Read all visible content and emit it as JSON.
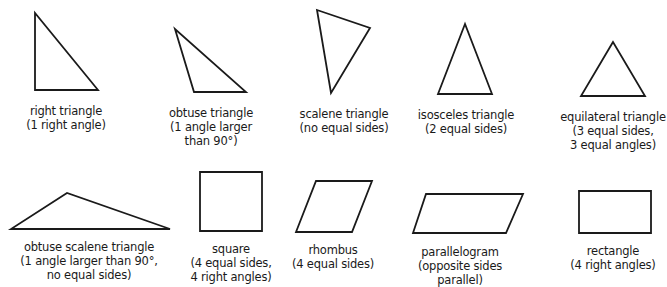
{
  "shapes": [
    {
      "id": "right-triangle",
      "name": "right triangle",
      "description_lines": [
        "(1 right angle)"
      ],
      "points": "35,13 35,90 98,90",
      "caption_x": 66,
      "caption_y": 104
    },
    {
      "id": "obtuse-triangle",
      "name": "obtuse triangle",
      "description_lines": [
        "(1 angle larger",
        "than 90°)"
      ],
      "points": "175,29 194,92 246,92",
      "caption_x": 211,
      "caption_y": 106
    },
    {
      "id": "scalene-triangle",
      "name": "scalene triangle",
      "description_lines": [
        "(no equal sides)"
      ],
      "points": "317,10 370,28 331,93",
      "caption_x": 344,
      "caption_y": 107
    },
    {
      "id": "isosceles-triangle",
      "name": "isosceles triangle",
      "description_lines": [
        "(2 equal sides)"
      ],
      "points": "465,24 438,94 492,94",
      "caption_x": 466,
      "caption_y": 108
    },
    {
      "id": "equilateral-triangle",
      "name": "equilateral triangle",
      "description_lines": [
        "(3 equal sides,",
        "3 equal angles)"
      ],
      "points": "613,42 581,96 645,96",
      "caption_x": 613,
      "caption_y": 110
    },
    {
      "id": "obtuse-scalene-triangle",
      "name": "obtuse scalene triangle",
      "description_lines": [
        "(1 angle larger than 90°,",
        "no equal sides)"
      ],
      "points": "67,193 11,229 170,229",
      "caption_x": 89,
      "caption_y": 240
    },
    {
      "id": "square",
      "name": "square",
      "description_lines": [
        "(4 equal sides,",
        "4 right angles)"
      ],
      "points": "200,172 262,172 262,231 200,231",
      "caption_x": 231,
      "caption_y": 242
    },
    {
      "id": "rhombus",
      "name": "rhombus",
      "description_lines": [
        "(4 equal sides)"
      ],
      "points": "316,181 372,181 352,232 296,232",
      "caption_x": 333,
      "caption_y": 243
    },
    {
      "id": "parallelogram",
      "name": "parallelogram",
      "description_lines": [
        "(opposite sides",
        "parallel)"
      ],
      "points": "426,194 523,194 506,233 413,233",
      "caption_x": 460,
      "caption_y": 245
    },
    {
      "id": "rectangle",
      "name": "rectangle",
      "description_lines": [
        "(4 right angles)"
      ],
      "points": "579,191 651,191 651,233 579,233",
      "caption_x": 613,
      "caption_y": 244
    }
  ]
}
